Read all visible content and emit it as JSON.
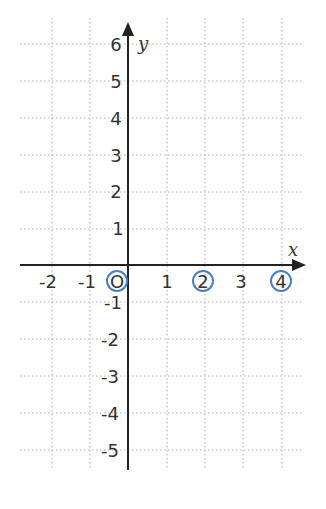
{
  "diagram": {
    "type": "coordinate-grid",
    "axes": {
      "x_label": "x",
      "y_label": "y",
      "x_ticks": [
        "-2",
        "-1",
        "O",
        "1",
        "2",
        "3",
        "4"
      ],
      "y_ticks_positive": [
        "1",
        "2",
        "3",
        "4",
        "5",
        "6"
      ],
      "y_ticks_negative": [
        "-1",
        "-2",
        "-3",
        "-4",
        "-5"
      ]
    },
    "circled_labels": [
      "O",
      "2",
      "4"
    ],
    "colors": {
      "axis": "#222222",
      "grid": "#b0b0b0",
      "circle": "#4a7fc8",
      "text": "#333333"
    }
  }
}
